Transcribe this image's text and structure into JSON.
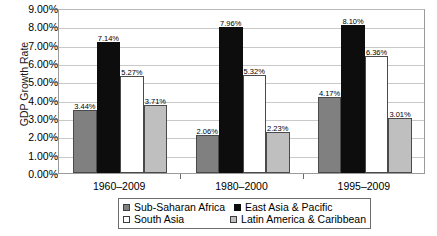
{
  "chart_data": {
    "type": "bar",
    "title": "",
    "xlabel": "",
    "ylabel": "GDP Growth Rate",
    "ylim": [
      0,
      9
    ],
    "ytick_step": 1,
    "ytick_labels": [
      "0.00%",
      "1.00%",
      "2.00%",
      "3.00%",
      "4.00%",
      "5.00%",
      "6.00%",
      "7.00%",
      "8.00%",
      "9.00%"
    ],
    "grid": "horizontal",
    "legend_position": "bottom",
    "categories": [
      "1960–2009",
      "1980–2000",
      "1995–2009"
    ],
    "series": [
      {
        "name": "Sub-Saharan Africa",
        "color": "#808080",
        "values": [
          3.44,
          2.06,
          4.17
        ],
        "labels": [
          "3.44%",
          "2.06%",
          "4.17%"
        ]
      },
      {
        "name": "East Asia & Pacific",
        "color": "#0d0d0d",
        "values": [
          7.14,
          7.96,
          8.1
        ],
        "labels": [
          "7.14%",
          "7.96%",
          "8.10%"
        ]
      },
      {
        "name": "South Asia",
        "color": "#ffffff",
        "values": [
          5.27,
          5.32,
          6.36
        ],
        "labels": [
          "5.27%",
          "5.32%",
          "6.36%"
        ]
      },
      {
        "name": "Latin America & Caribbean",
        "color": "#bfbfbf",
        "values": [
          3.71,
          2.23,
          3.01
        ],
        "labels": [
          "3.71%",
          "2.23%",
          "3.01%"
        ]
      }
    ],
    "legend_order": [
      "Sub-Saharan Africa",
      "East Asia & Pacific",
      "South Asia",
      "Latin America & Caribbean"
    ]
  }
}
